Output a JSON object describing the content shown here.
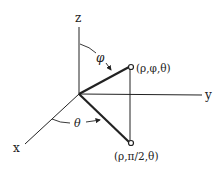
{
  "diagram": {
    "axes": {
      "x": "x",
      "y": "y",
      "z": "z"
    },
    "angles": {
      "phi": "φ",
      "theta": "θ"
    },
    "points": {
      "upper": "(ρ,φ,θ)",
      "lower": "(ρ,π/2,θ)"
    },
    "colors": {
      "ink": "#222222",
      "background": "#ffffff"
    }
  }
}
